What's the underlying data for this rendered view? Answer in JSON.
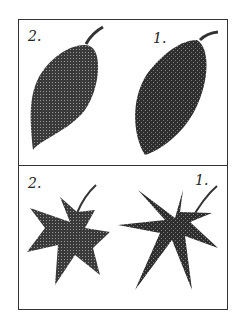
{
  "plate": {
    "top_panel": {
      "left_label": "2.",
      "right_label": "1.",
      "subject": "elliptic leaves"
    },
    "bottom_panel": {
      "left_label": "2.",
      "right_label": "1.",
      "subject": "palmate leaves"
    }
  }
}
